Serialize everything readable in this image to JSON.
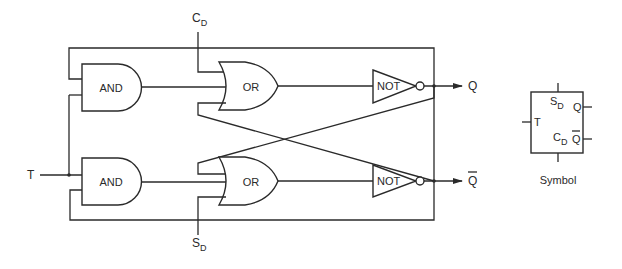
{
  "diagram": {
    "type": "logic-circuit",
    "gates": [
      {
        "id": "and_top",
        "type": "AND",
        "label": "AND"
      },
      {
        "id": "or_top",
        "type": "OR",
        "label": "OR"
      },
      {
        "id": "not_top",
        "type": "NOT",
        "label": "NOT"
      },
      {
        "id": "and_bottom",
        "type": "AND",
        "label": "AND"
      },
      {
        "id": "or_bottom",
        "type": "OR",
        "label": "OR"
      },
      {
        "id": "not_bottom",
        "type": "NOT",
        "label": "NOT"
      }
    ],
    "inputs": {
      "t": "T",
      "cd_main": "C",
      "cd_sub": "D",
      "sd_main": "S",
      "sd_sub": "D"
    },
    "outputs": {
      "q": "Q",
      "qbar": "Q"
    },
    "symbol": {
      "caption": "Symbol",
      "sd_main": "S",
      "sd_sub": "D",
      "cd_main": "C",
      "cd_sub": "D",
      "t": "T",
      "q": "Q",
      "qbar": "Q"
    },
    "colors": {
      "line": "#2a2a2a",
      "background": "#ffffff"
    }
  }
}
